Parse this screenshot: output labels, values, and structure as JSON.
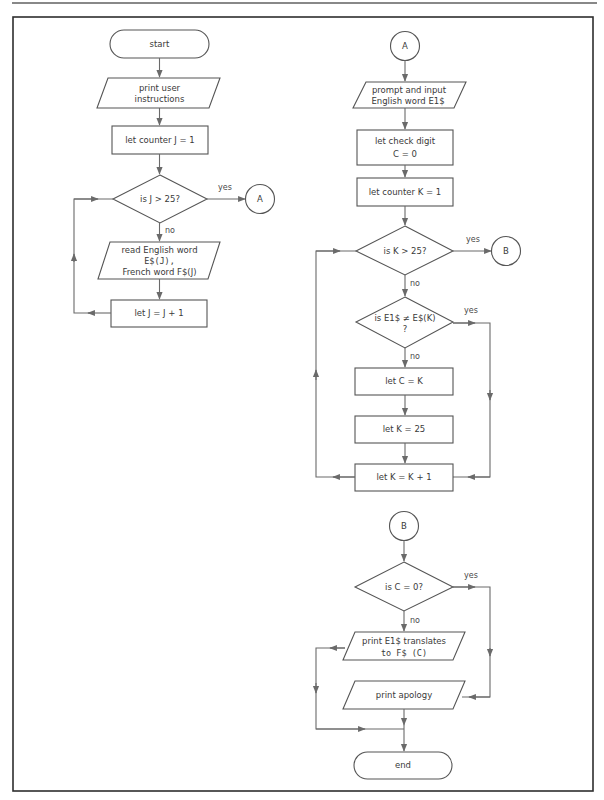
{
  "flowchart_left": {
    "start": "start",
    "print_instructions": [
      "print user",
      "instructions"
    ],
    "init_counter": "let counter J = 1",
    "decision": "is J > 25?",
    "decision_yes": "yes",
    "decision_no": "no",
    "connector_out": "A",
    "read_words": [
      "read English word",
      "E$(J),",
      "French word F$(J)"
    ],
    "increment": "let J = J + 1"
  },
  "flowchart_right_top": {
    "connector_in": "A",
    "prompt_input": [
      "prompt and input",
      "English word E1$"
    ],
    "init_check": [
      "let check digit",
      "C = 0"
    ],
    "init_counter": "let counter K = 1",
    "decision_k": "is K > 25?",
    "decision_k_yes": "yes",
    "decision_k_no": "no",
    "connector_out": "B",
    "decision_match": [
      "is E1$ ≠ E$(K)",
      "?"
    ],
    "decision_match_yes": "yes",
    "decision_match_no": "no",
    "set_c": "let C = K",
    "set_k": "let K = 25",
    "increment": "let K = K + 1"
  },
  "flowchart_right_bottom": {
    "connector_in": "B",
    "decision_c": "is C = 0?",
    "decision_c_yes": "yes",
    "decision_c_no": "no",
    "print_translation": [
      "print E1$ translates",
      "to F$ (C)"
    ],
    "print_apology": "print apology",
    "end": "end"
  },
  "colors": {
    "frame": "#2e2e2e",
    "shape_stroke": "#555555",
    "connector_line": "#6a6a6a",
    "text": "#3a3a3a",
    "background": "#ffffff"
  }
}
